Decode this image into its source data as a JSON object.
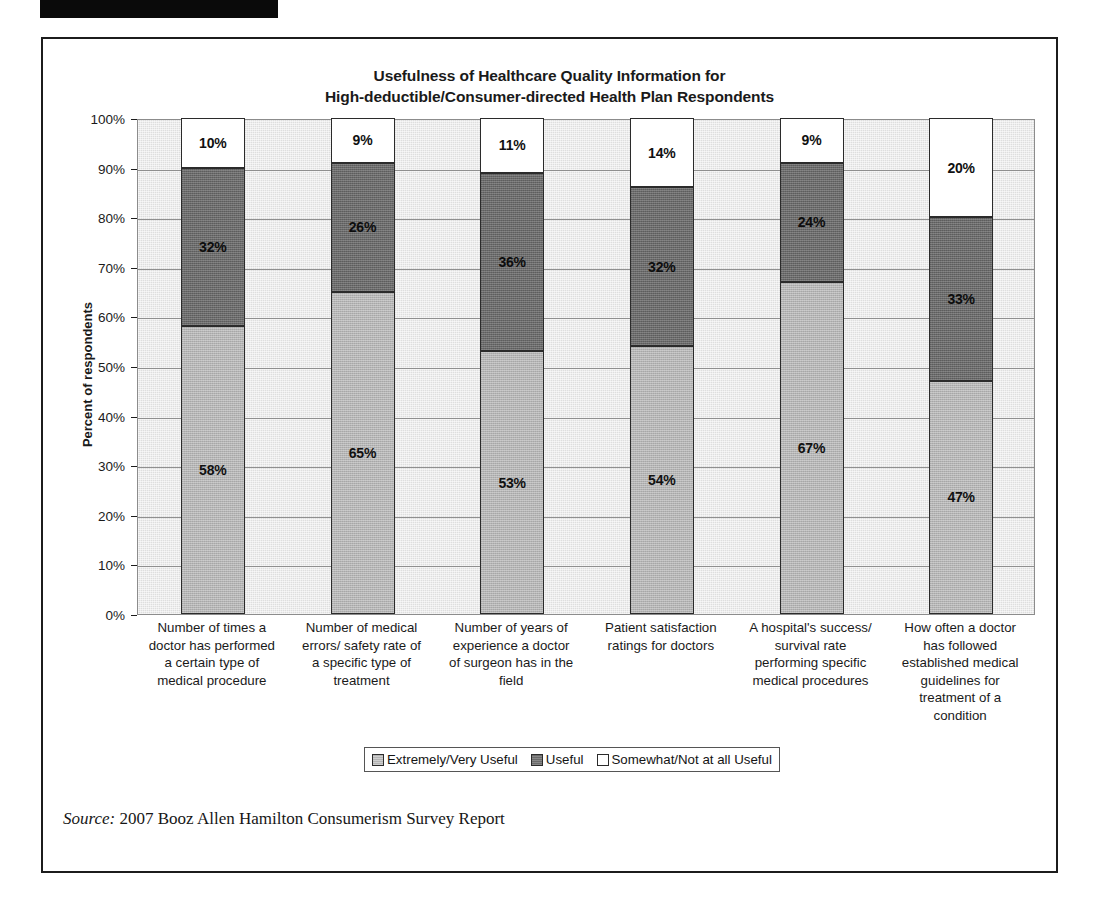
{
  "redaction": {
    "present": true
  },
  "chart_data": {
    "type": "bar",
    "subtype": "stacked-bar-100",
    "title": "Usefulness of Healthcare Quality Information for\nHigh-deductible/Consumer-directed Health Plan Respondents",
    "title_line1": "Usefulness of Healthcare Quality Information for",
    "title_line2": "High-deductible/Consumer-directed Health Plan Respondents",
    "xlabel": "",
    "ylabel": "Percent of respondents",
    "ylim": [
      0,
      100
    ],
    "grid": true,
    "legend_position": "bottom",
    "ytick_labels": [
      "100%",
      "90%",
      "80%",
      "70%",
      "60%",
      "50%",
      "40%",
      "30%",
      "20%",
      "10%",
      "0%"
    ],
    "ytick_values": [
      100,
      90,
      80,
      70,
      60,
      50,
      40,
      30,
      20,
      10,
      0
    ],
    "categories": [
      "Number of times a doctor has performed a certain type of medical procedure",
      "Number of medical errors/ safety rate of a specific type of treatment",
      "Number of years of experience a doctor of surgeon has in the field",
      "Patient satisfaction ratings for doctors",
      "A hospital's success/ survival rate performing specific medical procedures",
      "How often a doctor has followed established medical guidelines for treatment of a condition"
    ],
    "category_lines": [
      [
        "Number of times a",
        "doctor has performed",
        "a certain type of",
        "medical procedure"
      ],
      [
        "Number of medical",
        "errors/ safety rate of",
        "a specific type of",
        "treatment"
      ],
      [
        "Number of years of",
        "experience a doctor",
        "of surgeon has in the",
        "field"
      ],
      [
        "Patient satisfaction",
        "ratings for doctors"
      ],
      [
        "A hospital's success/",
        "survival rate",
        "performing specific",
        "medical procedures"
      ],
      [
        "How often a doctor",
        "has followed",
        "established medical",
        "guidelines for",
        "treatment of a",
        "condition"
      ]
    ],
    "series": [
      {
        "name": "Extremely/Very Useful",
        "color": "#b4b4b4",
        "values": [
          58,
          65,
          53,
          54,
          67,
          47
        ],
        "labels": [
          "58%",
          "65%",
          "53%",
          "54%",
          "67%",
          "47%"
        ]
      },
      {
        "name": "Useful",
        "color": "#6a6a6a",
        "values": [
          32,
          26,
          36,
          32,
          24,
          33
        ],
        "labels": [
          "32%",
          "26%",
          "36%",
          "32%",
          "24%",
          "33%"
        ]
      },
      {
        "name": "Somewhat/Not at all Useful",
        "color": "#ffffff",
        "values": [
          10,
          9,
          11,
          14,
          9,
          20
        ],
        "labels": [
          "10%",
          "9%",
          "11%",
          "14%",
          "9%",
          "20%"
        ]
      }
    ]
  },
  "legend": {
    "items": [
      {
        "label": "Extremely/Very Useful",
        "swatch": "low"
      },
      {
        "label": "Useful",
        "swatch": "mid"
      },
      {
        "label": "Somewhat/Not at all Useful",
        "swatch": "none"
      }
    ]
  },
  "source": {
    "label": "Source:",
    "text": " 2007 Booz Allen Hamilton Consumerism Survey Report"
  }
}
